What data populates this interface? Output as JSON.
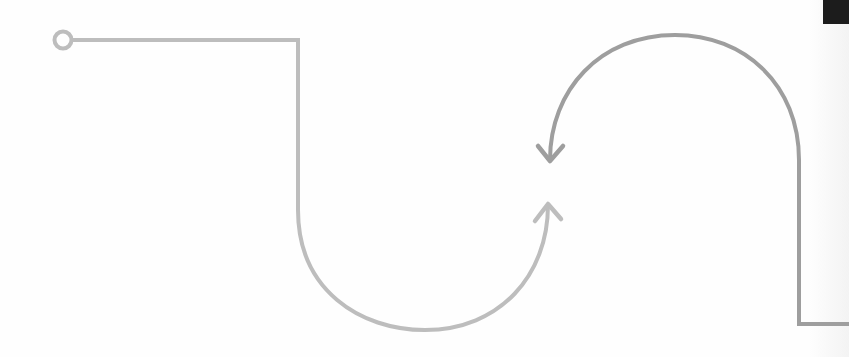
{
  "diagram": {
    "paths": [
      {
        "id": "light-path",
        "description": "Connector starting at a hollow circle, running right, dropping down and curving into a U that ends in an upward arrow",
        "start_marker": "circle-endpoint-icon",
        "end_marker": "arrow-up-icon",
        "color": "#bdbdbd"
      },
      {
        "id": "dark-path",
        "description": "Connector entering from the right edge, rising vertically and arcing over the top to end in a downward arrow",
        "start_marker": "none",
        "end_marker": "arrow-down-icon",
        "color": "#9e9e9e"
      }
    ],
    "colors": {
      "background": "#fefefe",
      "light_stroke": "#bdbdbd",
      "dark_stroke": "#9e9e9e",
      "corner_block": "#1c1c1c"
    }
  }
}
